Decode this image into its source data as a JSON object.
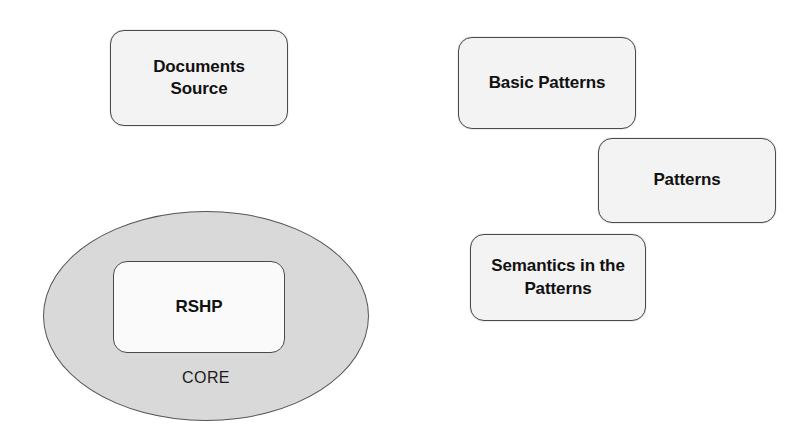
{
  "diagram": {
    "background_color": "#ffffff",
    "nodes": [
      {
        "id": "documents-source",
        "label": "Documents\nSource",
        "line1": "Documents",
        "line2": "Source",
        "shape": "rounded-rectangle",
        "fill": "#f3f3f3",
        "stroke": "#4a4a4a",
        "x": 110,
        "y": 30,
        "width": 178,
        "height": 96
      },
      {
        "id": "basic-patterns",
        "label": "Basic Patterns",
        "shape": "rounded-rectangle",
        "fill": "#f3f3f3",
        "stroke": "#4a4a4a",
        "x": 458,
        "y": 37,
        "width": 178,
        "height": 92
      },
      {
        "id": "patterns",
        "label": "Patterns",
        "shape": "rounded-rectangle",
        "fill": "#f3f3f3",
        "stroke": "#4a4a4a",
        "x": 598,
        "y": 138,
        "width": 178,
        "height": 85
      },
      {
        "id": "semantics-in-the-patterns",
        "label": "Semantics in the\nPatterns",
        "line1": "Semantics in the",
        "line2": "Patterns",
        "shape": "rounded-rectangle",
        "fill": "#f3f3f3",
        "stroke": "#4a4a4a",
        "x": 470,
        "y": 234,
        "width": 176,
        "height": 87
      }
    ],
    "core": {
      "ellipse_label": "CORE",
      "ellipse_fill": "#d9d9d9",
      "ellipse_stroke": "#555555",
      "x": 43,
      "y": 211,
      "width": 326,
      "height": 210,
      "inner": {
        "id": "rshp",
        "label": "RSHP",
        "shape": "rounded-rectangle",
        "fill": "#fafafa",
        "stroke": "#4a4a4a",
        "x": 113,
        "y": 261,
        "width": 172,
        "height": 92
      }
    }
  }
}
